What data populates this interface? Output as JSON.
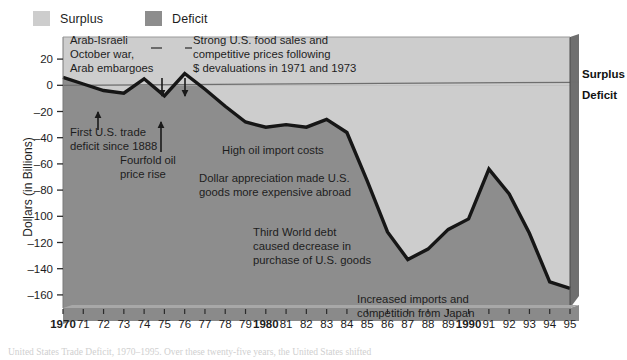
{
  "legend": {
    "items": [
      {
        "label": "Surplus",
        "color": "#cdcdcd"
      },
      {
        "label": "Deficit",
        "color": "#8d8d8d"
      }
    ]
  },
  "axis_side_labels": {
    "surplus": "Surplus",
    "deficit": "Deficit"
  },
  "caption": "United States Trade Deficit, 1970–1995. Over these twenty-five years, the United States shifted",
  "chart_data": {
    "type": "area",
    "title": "",
    "xlabel": "",
    "ylabel": "Dollars (in Billions)",
    "ylim": [
      -170,
      30
    ],
    "xlim": [
      1970,
      1995
    ],
    "grid": false,
    "legend_position": "top-left",
    "yticks": [
      20,
      0,
      -20,
      -40,
      -60,
      -80,
      -100,
      -120,
      -140,
      -160
    ],
    "ytick_labels": [
      "20",
      "0",
      "–20",
      "–40",
      "–60",
      "–80",
      "–100",
      "–120",
      "–140",
      "–160"
    ],
    "x": [
      1970,
      1971,
      1972,
      1973,
      1974,
      1975,
      1976,
      1977,
      1978,
      1979,
      1980,
      1981,
      1982,
      1983,
      1984,
      1985,
      1986,
      1987,
      1988,
      1989,
      1990,
      1991,
      1992,
      1993,
      1994,
      1995
    ],
    "xtick_labels": [
      "1970",
      "71",
      "72",
      "73",
      "74",
      "75",
      "76",
      "77",
      "78",
      "79",
      "1980",
      "81",
      "82",
      "83",
      "84",
      "85",
      "86",
      "87",
      "88",
      "89",
      "1990",
      "91",
      "92",
      "93",
      "94",
      "95"
    ],
    "xtick_bold": [
      true,
      false,
      false,
      false,
      false,
      false,
      false,
      false,
      false,
      false,
      true,
      false,
      false,
      false,
      false,
      false,
      false,
      false,
      false,
      false,
      true,
      false,
      false,
      false,
      false,
      false
    ],
    "values": [
      6,
      1,
      -4,
      -6,
      5,
      -8,
      9,
      -3,
      -16,
      -28,
      -32,
      -30,
      -32,
      -26,
      -36,
      -73,
      -112,
      -133,
      -125,
      -110,
      -102,
      -64,
      -83,
      -113,
      -150,
      -155
    ],
    "series_name": "U.S. trade balance",
    "colors": {
      "surplus_fill": "#cdcdcd",
      "deficit_fill": "#8d8d8d",
      "line": "#161616",
      "zero_line": "#6e6e6e",
      "frame": "#5f5f5f",
      "axis_band": "#8a8a8a"
    }
  },
  "annotations": [
    {
      "id": "arab-israeli",
      "lines": [
        "Arab-Israeli",
        "October war,",
        "Arab embargoes"
      ],
      "x": 70,
      "y": 44,
      "anchor": "start",
      "leader": {
        "x1": 151,
        "y1": 48,
        "x2": 162,
        "y2": 48,
        "x3": 162,
        "y3": 78
      },
      "arrow": {
        "x": 162,
        "y": 78,
        "len": 18
      }
    },
    {
      "id": "strong-food-sales",
      "lines": [
        "Strong U.S. food sales and",
        "competitive prices following",
        "$ devaluations in 1971 and 1973"
      ],
      "x": 193,
      "y": 44,
      "anchor": "start",
      "leader": {
        "x1": 185,
        "y1": 48,
        "x2": 192,
        "y2": 48,
        "x3": 185,
        "y3": 78
      },
      "arrow": {
        "x": 185,
        "y": 78,
        "len": 18
      }
    },
    {
      "id": "first-trade-deficit",
      "lines": [
        "First U.S. trade",
        "deficit since 1888"
      ],
      "x": 70,
      "y": 136,
      "anchor": "start",
      "arrow": {
        "x": 98,
        "y": 112,
        "len": 18,
        "up": true
      }
    },
    {
      "id": "fourfold-oil",
      "lines": [
        "Fourfold oil",
        "price rise"
      ],
      "x": 120,
      "y": 164,
      "anchor": "start",
      "arrow": {
        "x": 161,
        "y": 122,
        "len": 30,
        "up": true
      }
    },
    {
      "id": "high-oil-import",
      "lines": [
        "High oil import costs"
      ],
      "x": 222,
      "y": 154,
      "anchor": "start"
    },
    {
      "id": "dollar-appreciation",
      "lines": [
        "Dollar appreciation made U.S.",
        "goods more expensive abroad"
      ],
      "x": 199,
      "y": 182,
      "anchor": "start"
    },
    {
      "id": "third-world-debt",
      "lines": [
        "Third World debt",
        "caused decrease in",
        "purchase of U.S. goods"
      ],
      "x": 253,
      "y": 236,
      "anchor": "start"
    },
    {
      "id": "increased-imports",
      "lines": [
        "Increased imports and",
        "competition from Japan"
      ],
      "x": 357,
      "y": 303,
      "anchor": "start"
    }
  ]
}
